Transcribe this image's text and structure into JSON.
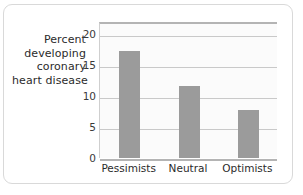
{
  "chart_data": {
    "type": "bar",
    "title": "",
    "xlabel": "",
    "ylabel": "Percent developing coronary heart disease",
    "ylabel_lines": [
      "Percent",
      "developing",
      "coronary",
      "heart disease"
    ],
    "categories": [
      "Pessimists",
      "Neutral",
      "Optimists"
    ],
    "values": [
      17.3,
      11.7,
      7.8
    ],
    "ylim": [
      0,
      20
    ],
    "y_axis_top_value": 22,
    "yticks": [
      0,
      5,
      10,
      15,
      20
    ],
    "ytick_labels": [
      "0",
      "5",
      "10",
      "15",
      "20"
    ],
    "grid": true,
    "grid_axis": "y",
    "legend": "none",
    "bar_color": "#9b9b9b",
    "plot_background": "#fbfbfb",
    "gridline_color": "#c9c9c9",
    "axis_color": "#b4b4b4",
    "frame_color": "#d9d9d9",
    "text_color": "#2b2b2b"
  }
}
